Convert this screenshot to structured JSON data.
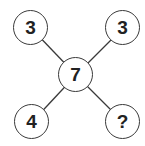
{
  "diagram": {
    "type": "number-puzzle",
    "center": {
      "value": "7",
      "cx": 76,
      "cy": 75
    },
    "nodes": [
      {
        "id": "top-left",
        "value": "3",
        "cx": 31,
        "cy": 28
      },
      {
        "id": "top-right",
        "value": "3",
        "cx": 123,
        "cy": 28
      },
      {
        "id": "bottom-left",
        "value": "4",
        "cx": 32,
        "cy": 122
      },
      {
        "id": "bottom-right",
        "value": "?",
        "cx": 123,
        "cy": 122
      }
    ],
    "colors": {
      "stroke": "#3a3a3a",
      "text": "#222222",
      "background": "#ffffff"
    }
  }
}
